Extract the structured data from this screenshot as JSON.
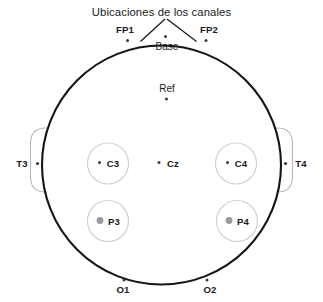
{
  "diagram": {
    "title": "Ubicaciones de los canales",
    "head_outline_name": "head-outline",
    "colors": {
      "head_stroke": "#151515",
      "ring_stroke": "#cfcfcf",
      "ear_stroke": "#b9b9b9",
      "dot_dark": "#3a3a3a",
      "dot_gray": "#9a9a9a",
      "background": "#ffffff"
    },
    "electrodes": [
      {
        "label": "FP1",
        "group": "frontal-left"
      },
      {
        "label": "FP2",
        "group": "frontal-right"
      },
      {
        "label": "Base",
        "group": "reference-base"
      },
      {
        "label": "Ref",
        "group": "reference"
      },
      {
        "label": "T3",
        "group": "temporal-left"
      },
      {
        "label": "T4",
        "group": "temporal-right"
      },
      {
        "label": "C3",
        "group": "central-left"
      },
      {
        "label": "Cz",
        "group": "central-midline"
      },
      {
        "label": "C4",
        "group": "central-right"
      },
      {
        "label": "P3",
        "group": "parietal-left"
      },
      {
        "label": "P4",
        "group": "parietal-right"
      },
      {
        "label": "O1",
        "group": "occipital-left"
      },
      {
        "label": "O2",
        "group": "occipital-right"
      }
    ]
  }
}
